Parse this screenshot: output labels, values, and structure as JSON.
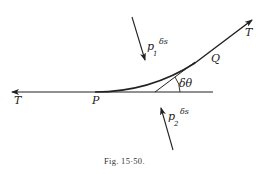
{
  "figure": {
    "caption": "Fig. 15·50.",
    "colors": {
      "ink": "#222222",
      "background": "#ffffff"
    },
    "labels": {
      "tension_left": "T",
      "tension_right": "T",
      "point_p": "P",
      "point_q": "Q",
      "angle": "δθ",
      "pressure_top_symbol": "p",
      "pressure_top_subscript": "1",
      "pressure_top_suffix": "δs",
      "pressure_bottom_symbol": "p",
      "pressure_bottom_subscript": "2",
      "pressure_bottom_suffix": "δs"
    }
  }
}
